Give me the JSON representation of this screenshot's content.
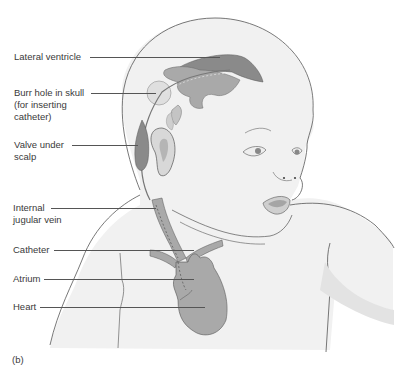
{
  "figure": {
    "panel_label": "(b)",
    "labels": [
      {
        "id": "lateral-ventricle",
        "lines": [
          "Lateral ventricle"
        ]
      },
      {
        "id": "burr-hole",
        "lines": [
          "Burr hole in skull",
          "(for inserting",
          "catheter)"
        ]
      },
      {
        "id": "valve",
        "lines": [
          "Valve under",
          "scalp"
        ]
      },
      {
        "id": "jugular-vein",
        "lines": [
          "Internal",
          "jugular vein"
        ]
      },
      {
        "id": "catheter",
        "lines": [
          "Catheter"
        ]
      },
      {
        "id": "atrium",
        "lines": [
          "Atrium"
        ]
      },
      {
        "id": "heart",
        "lines": [
          "Heart"
        ]
      }
    ],
    "colors": {
      "skin_fill": "#f1f1f1",
      "outline": "#555555",
      "structure_dark": "#8a8a8a",
      "structure_mid": "#a9a9a9",
      "structure_light": "#cfcfcf",
      "text": "#3a3a3a"
    }
  }
}
